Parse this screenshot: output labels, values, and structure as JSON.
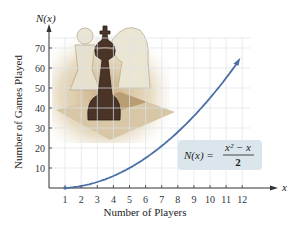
{
  "chart_data": {
    "type": "line",
    "title": "",
    "function_label": "N(x) = (x^2 - x) / 2",
    "formula": {
      "lhs": "N(x) =",
      "numerator": "x² − x",
      "denominator": "2"
    },
    "xlabel": "Number of Players",
    "ylabel": "Number of Games Played",
    "x_axis_symbol": "x",
    "y_axis_symbol": "N(x)",
    "x_ticks": [
      1,
      2,
      3,
      4,
      5,
      6,
      7,
      8,
      9,
      10,
      11,
      12
    ],
    "y_ticks": [
      10,
      20,
      30,
      40,
      50,
      60,
      70
    ],
    "xlim": [
      0,
      12.5
    ],
    "ylim": [
      0,
      75
    ],
    "grid": true,
    "series": [
      {
        "name": "N(x)",
        "x": [
          1,
          2,
          3,
          4,
          5,
          6,
          7,
          8,
          9,
          10,
          11,
          12
        ],
        "y": [
          0,
          1,
          3,
          6,
          10,
          15,
          21,
          28,
          36,
          45,
          55,
          66
        ]
      }
    ],
    "colors": {
      "curve": "#4a6fa5",
      "grid": "#dde3ea",
      "formula_box": "#dbe6ec"
    },
    "background_image": "chess pieces (pawn, king, knight) on chessboard"
  }
}
